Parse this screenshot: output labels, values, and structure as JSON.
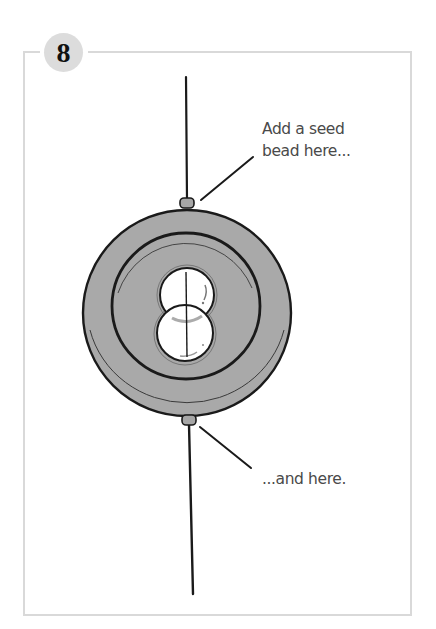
{
  "step": {
    "number": "8",
    "badge_color": "#dcdcdc"
  },
  "callouts": {
    "top": {
      "line1": "Add a seed",
      "line2": "bead here..."
    },
    "bottom": {
      "line1": "...and here."
    }
  },
  "illustration": {
    "subject": "donut-bead-with-two-pearls-and-seed-beads",
    "colors": {
      "ring_fill": "#a9a9a9",
      "outline": "#1a1a1a",
      "pearl_fill": "#ffffff",
      "seed_bead_fill": "#a6a6a6",
      "frame": "#d9d9d9",
      "text": "#4a4a4a"
    }
  }
}
